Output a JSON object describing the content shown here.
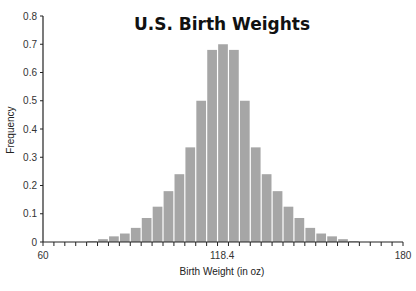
{
  "chart_data": {
    "type": "bar",
    "title": "U.S. Birth Weights",
    "xlabel": "Birth Weight (in oz)",
    "ylabel": "Frequency",
    "xlim": [
      60,
      180
    ],
    "ylim": [
      0,
      0.8
    ],
    "x_tick_labels": [
      {
        "value": 60,
        "label": "60"
      },
      {
        "value": 118.4,
        "label": "118.4"
      },
      {
        "value": 180,
        "label": "180"
      }
    ],
    "y_ticks": [
      0,
      0.1,
      0.2,
      0.3,
      0.4,
      0.5,
      0.6,
      0.7,
      0.8
    ],
    "y_tick_labels": [
      "0",
      "0.1",
      "0.2",
      "0.3",
      "0.4",
      "0.5",
      "0.6",
      "0.7",
      "0.8"
    ],
    "bin_count_axis": 33,
    "bin_width": 3.636,
    "bins_start_index": 4,
    "values": [
      0.003,
      0.01,
      0.02,
      0.03,
      0.05,
      0.085,
      0.125,
      0.18,
      0.24,
      0.335,
      0.5,
      0.68,
      0.7,
      0.68,
      0.5,
      0.335,
      0.24,
      0.18,
      0.125,
      0.085,
      0.05,
      0.03,
      0.02,
      0.01,
      0.003
    ],
    "bar_color": "#a6a6a6",
    "grid": false,
    "legend": null
  }
}
